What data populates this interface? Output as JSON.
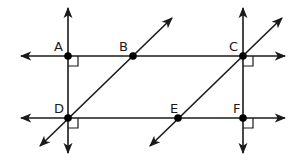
{
  "diagram": {
    "points": [
      {
        "label": "A",
        "x": 68,
        "y": 56
      },
      {
        "label": "B",
        "x": 133,
        "y": 56
      },
      {
        "label": "C",
        "x": 243,
        "y": 56
      },
      {
        "label": "D",
        "x": 68,
        "y": 118
      },
      {
        "label": "E",
        "x": 178,
        "y": 118
      },
      {
        "label": "F",
        "x": 243,
        "y": 118
      }
    ],
    "lines": [
      {
        "name": "line-AC",
        "through": [
          "A",
          "B",
          "C"
        ],
        "direction": "horizontal"
      },
      {
        "name": "line-DF",
        "through": [
          "D",
          "E",
          "F"
        ],
        "direction": "horizontal"
      },
      {
        "name": "line-AD",
        "through": [
          "A",
          "D"
        ],
        "direction": "vertical"
      },
      {
        "name": "line-CF",
        "through": [
          "C",
          "F"
        ],
        "direction": "vertical"
      },
      {
        "name": "line-BD",
        "through": [
          "B",
          "D"
        ],
        "direction": "diagonal"
      },
      {
        "name": "line-CE",
        "through": [
          "C",
          "E"
        ],
        "direction": "diagonal"
      }
    ],
    "right_angles": [
      "A",
      "C",
      "D",
      "F"
    ],
    "colors": {
      "stroke": "#1a1a1a",
      "point": "#000000",
      "background": "#ffffff"
    }
  }
}
